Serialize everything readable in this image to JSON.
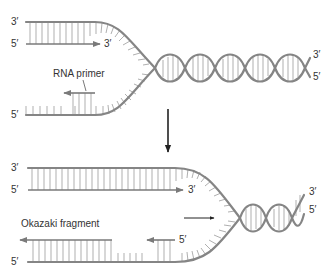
{
  "diagram": {
    "colors": {
      "strand": "#858585",
      "rung": "#a6a6a6",
      "arrow": "#333333",
      "text": "#333333",
      "background": "#ffffff"
    },
    "top_panel": {
      "upper_strand_left_label": "3′",
      "leading_strand_left_label": "5′",
      "leading_strand_end_label": "3′",
      "lower_strand_left_label": "5′",
      "primer_label": "RNA primer",
      "helix_end_label_top": "3′",
      "helix_end_label_bottom": "5′"
    },
    "transition_arrow": "down-arrow",
    "bottom_panel": {
      "upper_strand_left_label": "3′",
      "leading_strand_left_label": "5′",
      "leading_strand_end_label": "3′",
      "lower_strand_left_label": "5′",
      "okazaki_label": "Okazaki fragment",
      "new_fragment_end_label": "5′",
      "helix_end_label_top": "3′",
      "helix_end_label_bottom": "5′",
      "fork_direction_arrow": "right-arrow"
    }
  }
}
